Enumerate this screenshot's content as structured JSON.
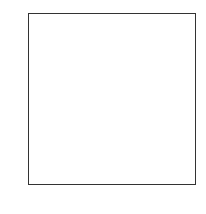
{
  "chart_data": {
    "type": "heatmap",
    "title": "",
    "xlabel": "",
    "ylabel": "",
    "colormap": "gray_r",
    "shape": [
      28,
      28
    ],
    "xlim": [
      -0.5,
      27.5
    ],
    "ylim": [
      27.5,
      -0.5
    ],
    "xticks": [
      0,
      5,
      10,
      15,
      20,
      25
    ],
    "yticks": [
      0,
      5,
      10,
      15,
      20,
      25
    ],
    "pixels": [
      {
        "r": 6,
        "c": 13,
        "v": 30
      },
      {
        "r": 6,
        "c": 14,
        "v": 30
      },
      {
        "r": 6,
        "c": 15,
        "v": 30
      },
      {
        "r": 6,
        "c": 16,
        "v": 20
      },
      {
        "r": 7,
        "c": 12,
        "v": 60
      },
      {
        "r": 7,
        "c": 13,
        "v": 250
      },
      {
        "r": 7,
        "c": 14,
        "v": 255
      },
      {
        "r": 7,
        "c": 15,
        "v": 255
      },
      {
        "r": 7,
        "c": 16,
        "v": 250
      },
      {
        "r": 7,
        "c": 17,
        "v": 90
      },
      {
        "r": 8,
        "c": 11,
        "v": 60
      },
      {
        "r": 8,
        "c": 12,
        "v": 240
      },
      {
        "r": 8,
        "c": 13,
        "v": 255
      },
      {
        "r": 8,
        "c": 14,
        "v": 160
      },
      {
        "r": 8,
        "c": 15,
        "v": 20
      },
      {
        "r": 8,
        "c": 16,
        "v": 250
      },
      {
        "r": 8,
        "c": 17,
        "v": 220
      },
      {
        "r": 9,
        "c": 10,
        "v": 90
      },
      {
        "r": 9,
        "c": 11,
        "v": 250
      },
      {
        "r": 9,
        "c": 12,
        "v": 250
      },
      {
        "r": 9,
        "c": 13,
        "v": 180
      },
      {
        "r": 9,
        "c": 14,
        "v": 40
      },
      {
        "r": 9,
        "c": 15,
        "v": 10
      },
      {
        "r": 9,
        "c": 16,
        "v": 250
      },
      {
        "r": 9,
        "c": 17,
        "v": 210
      },
      {
        "r": 9,
        "c": 18,
        "v": 30
      },
      {
        "r": 10,
        "c": 10,
        "v": 250
      },
      {
        "r": 10,
        "c": 11,
        "v": 240
      },
      {
        "r": 10,
        "c": 12,
        "v": 110
      },
      {
        "r": 10,
        "c": 13,
        "v": 10
      },
      {
        "r": 10,
        "c": 14,
        "v": 60
      },
      {
        "r": 10,
        "c": 15,
        "v": 240
      },
      {
        "r": 10,
        "c": 16,
        "v": 255
      },
      {
        "r": 10,
        "c": 17,
        "v": 200
      },
      {
        "r": 10,
        "c": 18,
        "v": 40
      },
      {
        "r": 11,
        "c": 9,
        "v": 40
      },
      {
        "r": 11,
        "c": 10,
        "v": 255
      },
      {
        "r": 11,
        "c": 11,
        "v": 200
      },
      {
        "r": 11,
        "c": 12,
        "v": 40
      },
      {
        "r": 11,
        "c": 13,
        "v": 20
      },
      {
        "r": 11,
        "c": 14,
        "v": 180
      },
      {
        "r": 11,
        "c": 15,
        "v": 255
      },
      {
        "r": 11,
        "c": 16,
        "v": 250
      },
      {
        "r": 11,
        "c": 17,
        "v": 120
      },
      {
        "r": 12,
        "c": 9,
        "v": 70
      },
      {
        "r": 12,
        "c": 10,
        "v": 255
      },
      {
        "r": 12,
        "c": 11,
        "v": 150
      },
      {
        "r": 12,
        "c": 12,
        "v": 20
      },
      {
        "r": 12,
        "c": 13,
        "v": 120
      },
      {
        "r": 12,
        "c": 14,
        "v": 250
      },
      {
        "r": 12,
        "c": 15,
        "v": 255
      },
      {
        "r": 12,
        "c": 16,
        "v": 240
      },
      {
        "r": 12,
        "c": 17,
        "v": 60
      },
      {
        "r": 13,
        "c": 9,
        "v": 50
      },
      {
        "r": 13,
        "c": 10,
        "v": 255
      },
      {
        "r": 13,
        "c": 11,
        "v": 200
      },
      {
        "r": 13,
        "c": 12,
        "v": 250
      },
      {
        "r": 13,
        "c": 13,
        "v": 255
      },
      {
        "r": 13,
        "c": 14,
        "v": 255
      },
      {
        "r": 13,
        "c": 15,
        "v": 255
      },
      {
        "r": 13,
        "c": 16,
        "v": 200
      },
      {
        "r": 13,
        "c": 17,
        "v": 40
      },
      {
        "r": 14,
        "c": 10,
        "v": 240
      },
      {
        "r": 14,
        "c": 11,
        "v": 255
      },
      {
        "r": 14,
        "c": 12,
        "v": 255
      },
      {
        "r": 14,
        "c": 13,
        "v": 250
      },
      {
        "r": 14,
        "c": 14,
        "v": 200
      },
      {
        "r": 14,
        "c": 15,
        "v": 255
      },
      {
        "r": 14,
        "c": 16,
        "v": 150
      },
      {
        "r": 15,
        "c": 10,
        "v": 110
      },
      {
        "r": 15,
        "c": 11,
        "v": 230
      },
      {
        "r": 15,
        "c": 12,
        "v": 210
      },
      {
        "r": 15,
        "c": 13,
        "v": 200
      },
      {
        "r": 15,
        "c": 14,
        "v": 250
      },
      {
        "r": 15,
        "c": 15,
        "v": 255
      },
      {
        "r": 15,
        "c": 16,
        "v": 180
      },
      {
        "r": 16,
        "c": 11,
        "v": 50
      },
      {
        "r": 16,
        "c": 12,
        "v": 50
      },
      {
        "r": 16,
        "c": 13,
        "v": 20
      },
      {
        "r": 16,
        "c": 14,
        "v": 130
      },
      {
        "r": 16,
        "c": 15,
        "v": 255
      },
      {
        "r": 16,
        "c": 16,
        "v": 70
      },
      {
        "r": 17,
        "c": 14,
        "v": 60
      },
      {
        "r": 17,
        "c": 15,
        "v": 255
      },
      {
        "r": 17,
        "c": 16,
        "v": 110
      },
      {
        "r": 18,
        "c": 14,
        "v": 230
      },
      {
        "r": 18,
        "c": 15,
        "v": 200
      },
      {
        "r": 18,
        "c": 16,
        "v": 50
      },
      {
        "r": 19,
        "c": 13,
        "v": 50
      },
      {
        "r": 19,
        "c": 14,
        "v": 255
      },
      {
        "r": 19,
        "c": 15,
        "v": 130
      },
      {
        "r": 20,
        "c": 13,
        "v": 120
      },
      {
        "r": 20,
        "c": 14,
        "v": 250
      },
      {
        "r": 20,
        "c": 15,
        "v": 60
      },
      {
        "r": 21,
        "c": 13,
        "v": 190
      },
      {
        "r": 21,
        "c": 14,
        "v": 250
      },
      {
        "r": 21,
        "c": 15,
        "v": 40
      },
      {
        "r": 22,
        "c": 13,
        "v": 240
      },
      {
        "r": 22,
        "c": 14,
        "v": 240
      },
      {
        "r": 22,
        "c": 15,
        "v": 30
      },
      {
        "r": 23,
        "c": 13,
        "v": 255
      },
      {
        "r": 23,
        "c": 14,
        "v": 200
      },
      {
        "r": 24,
        "c": 13,
        "v": 255
      },
      {
        "r": 24,
        "c": 14,
        "v": 150
      },
      {
        "r": 25,
        "c": 13,
        "v": 255
      },
      {
        "r": 25,
        "c": 14,
        "v": 170
      },
      {
        "r": 26,
        "c": 13,
        "v": 250
      },
      {
        "r": 26,
        "c": 14,
        "v": 80
      }
    ]
  }
}
